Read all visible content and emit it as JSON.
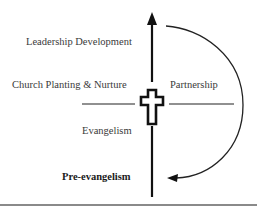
{
  "diagram": {
    "labels": {
      "leadership_development": "Leadership Development",
      "church_planting": "Church Planting & Nurture",
      "partnership": "Partnership",
      "evangelism": "Evangelism",
      "pre_evangelism": "Pre-evangelism"
    },
    "center_symbol": "cross-icon",
    "colors": {
      "ink": "#111111",
      "text": "#3a3a3a",
      "rule": "#8a8a8a"
    }
  }
}
